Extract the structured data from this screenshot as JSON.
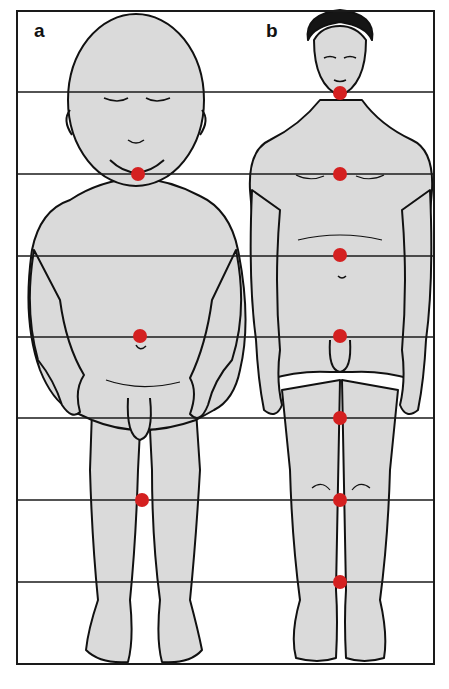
{
  "panels": [
    {
      "label": "a",
      "subject": "infant",
      "midpoints_y": [
        174,
        336,
        500
      ]
    },
    {
      "label": "b",
      "subject": "adult",
      "midpoints_y": [
        93,
        174,
        255,
        336,
        418,
        500,
        582
      ]
    }
  ],
  "grid": {
    "frame": {
      "x": 17,
      "y": 11,
      "width": 417,
      "height": 653
    },
    "lines_y": [
      92,
      174,
      256,
      337,
      418,
      500,
      582
    ],
    "line_color": "#1a1a1a"
  },
  "colors": {
    "marker": "#d42020",
    "body_fill": "#dadada",
    "outline": "#111111",
    "hair": "#151515"
  }
}
